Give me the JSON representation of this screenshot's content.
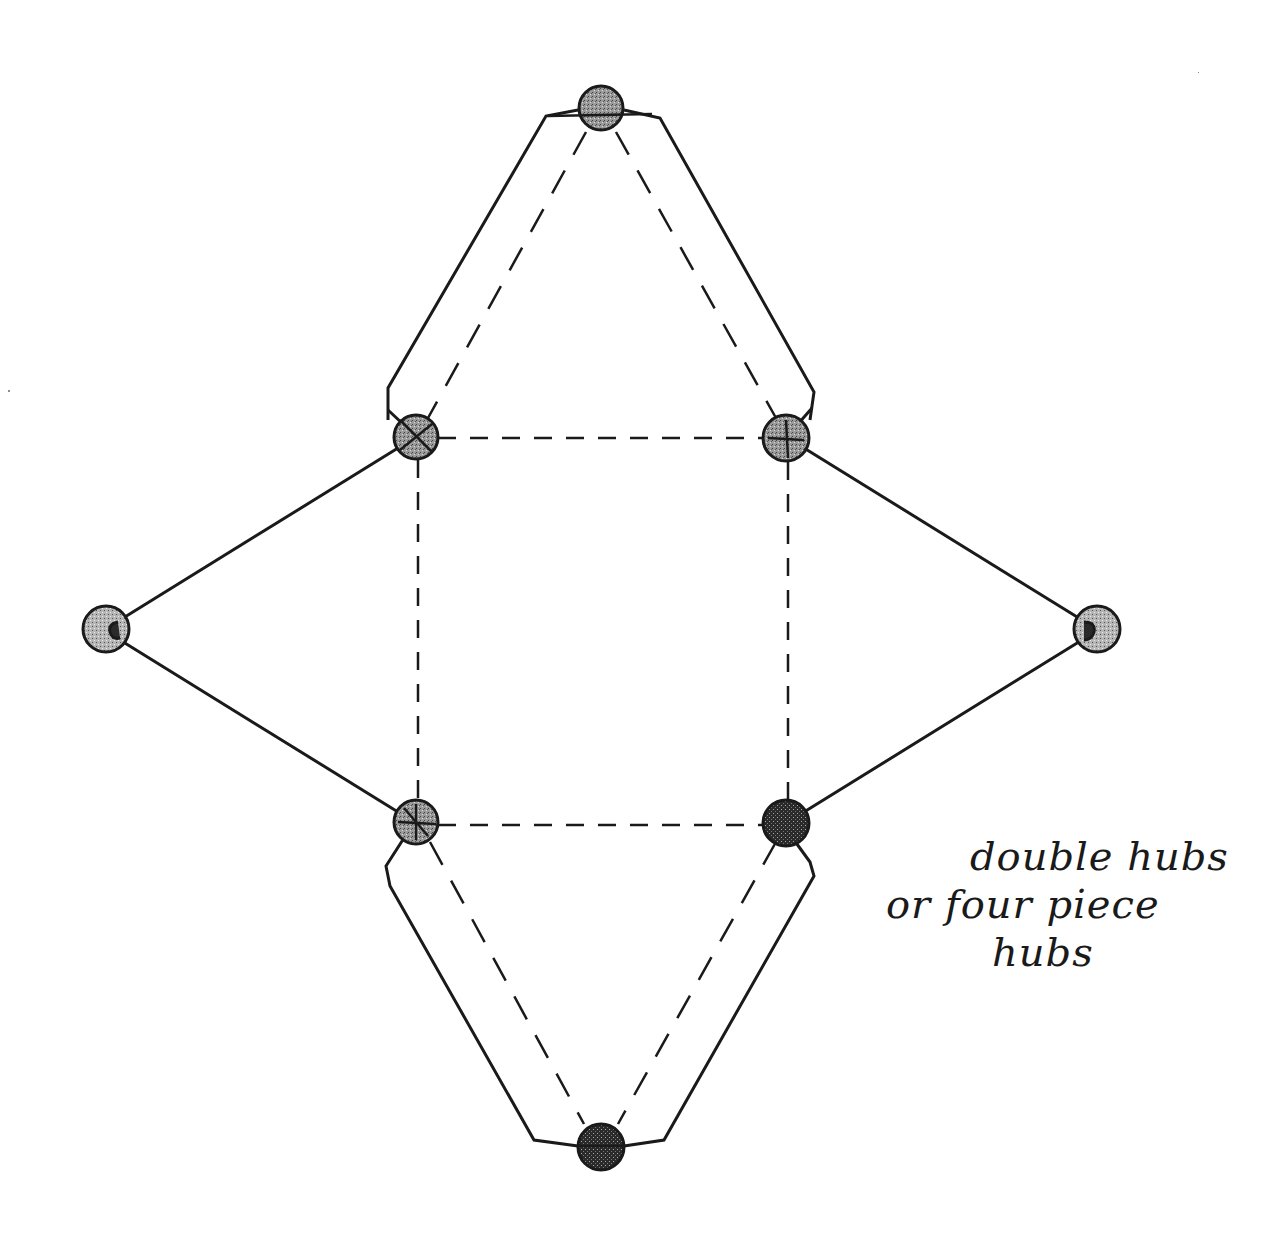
{
  "diagram": {
    "title": "",
    "colors": {
      "ink": "#1a1a1a",
      "hub_fill": "#8a8a8a",
      "hub_fill_dark": "#3a3a3a",
      "background": "#ffffff"
    },
    "hubs": [
      {
        "id": "top",
        "x": 601,
        "y": 108,
        "r": 22,
        "shade": "mid"
      },
      {
        "id": "upper-left",
        "x": 416,
        "y": 437,
        "r": 22,
        "shade": "mid"
      },
      {
        "id": "upper-right",
        "x": 786,
        "y": 438,
        "r": 23,
        "shade": "mid"
      },
      {
        "id": "left",
        "x": 106,
        "y": 629,
        "r": 23,
        "shade": "light"
      },
      {
        "id": "right",
        "x": 1097,
        "y": 629,
        "r": 23,
        "shade": "light"
      },
      {
        "id": "lower-left",
        "x": 416,
        "y": 822,
        "r": 22,
        "shade": "mid"
      },
      {
        "id": "lower-right",
        "x": 786,
        "y": 823,
        "r": 23,
        "shade": "dark"
      },
      {
        "id": "bottom",
        "x": 601,
        "y": 1147,
        "r": 23,
        "shade": "dark"
      }
    ],
    "annotation": {
      "lines": [
        "double hubs",
        "or four piece",
        "hubs"
      ]
    }
  }
}
